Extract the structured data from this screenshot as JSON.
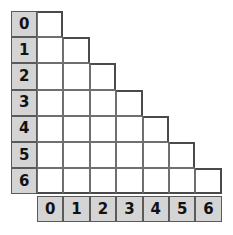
{
  "figure": {
    "type": "staircase-grid",
    "rows": 7,
    "cols": 7
  },
  "colors": {
    "header_fill": "#d4d4d4",
    "body_fill": "#ffffff",
    "grid_line": "#6f6f6f",
    "outline": "#4a4a4a",
    "text": "#121212",
    "background": "#ffffff"
  },
  "row_headers": [
    {
      "label": "0",
      "index": 0,
      "cells_in_row": 1
    },
    {
      "label": "1",
      "index": 1,
      "cells_in_row": 2
    },
    {
      "label": "2",
      "index": 2,
      "cells_in_row": 3
    },
    {
      "label": "3",
      "index": 3,
      "cells_in_row": 4
    },
    {
      "label": "4",
      "index": 4,
      "cells_in_row": 5
    },
    {
      "label": "5",
      "index": 5,
      "cells_in_row": 6
    },
    {
      "label": "6",
      "index": 6,
      "cells_in_row": 7
    }
  ],
  "column_headers": [
    {
      "label": "0",
      "index": 0
    },
    {
      "label": "1",
      "index": 1
    },
    {
      "label": "2",
      "index": 2
    },
    {
      "label": "3",
      "index": 3
    },
    {
      "label": "4",
      "index": 4
    },
    {
      "label": "5",
      "index": 5
    },
    {
      "label": "6",
      "index": 6
    }
  ],
  "geometry": {
    "cell_width": 26.4,
    "cell_height": 26.2,
    "grid_left": 11,
    "grid_top": 11,
    "body_left": 37,
    "header_row_top": 196
  }
}
